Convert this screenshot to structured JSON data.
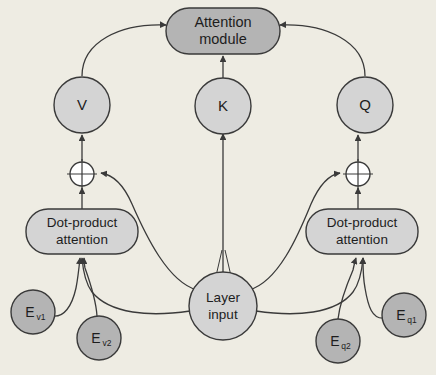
{
  "diagram": {
    "background_color": "#eeece3",
    "palette": {
      "dark_gray_fill": "#b4b4b4",
      "light_gray_fill": "#d4d4d4",
      "white_fill": "#ffffff",
      "stroke": "#3a3a3a",
      "text": "#1d1d1d"
    },
    "nodes": {
      "attention_module": {
        "label_line1": "Attention",
        "label_line2": "module",
        "shape": "rounded-rect",
        "fill": "#b4b4b4"
      },
      "v": {
        "label": "V",
        "shape": "circle",
        "fill": "#d4d4d4"
      },
      "k": {
        "label": "K",
        "shape": "circle",
        "fill": "#d4d4d4"
      },
      "q": {
        "label": "Q",
        "shape": "circle",
        "fill": "#d4d4d4"
      },
      "sum_left": {
        "label": "+",
        "shape": "circle-plus",
        "fill": "#ffffff"
      },
      "sum_right": {
        "label": "+",
        "shape": "circle-plus",
        "fill": "#ffffff"
      },
      "dot_product_left": {
        "label_line1": "Dot-product",
        "label_line2": "attention",
        "shape": "rounded-rect",
        "fill": "#d4d4d4"
      },
      "dot_product_right": {
        "label_line1": "Dot-product",
        "label_line2": "attention",
        "shape": "rounded-rect",
        "fill": "#d4d4d4"
      },
      "layer_input": {
        "label_line1": "Layer",
        "label_line2": "input",
        "shape": "circle",
        "fill": "#d4d4d4"
      },
      "e_v1": {
        "label_base": "E",
        "label_sub": "v1",
        "shape": "circle",
        "fill": "#b4b4b4"
      },
      "e_v2": {
        "label_base": "E",
        "label_sub": "v2",
        "shape": "circle",
        "fill": "#b4b4b4"
      },
      "e_q1": {
        "label_base": "E",
        "label_sub": "q1",
        "shape": "circle",
        "fill": "#b4b4b4"
      },
      "e_q2": {
        "label_base": "E",
        "label_sub": "q2",
        "shape": "circle",
        "fill": "#b4b4b4"
      }
    },
    "edges": [
      {
        "from": "v",
        "to": "attention_module",
        "style": "curved-arrow"
      },
      {
        "from": "k",
        "to": "attention_module",
        "style": "straight-arrow"
      },
      {
        "from": "q",
        "to": "attention_module",
        "style": "curved-arrow"
      },
      {
        "from": "sum_left",
        "to": "v",
        "style": "straight-arrow"
      },
      {
        "from": "sum_right",
        "to": "q",
        "style": "straight-arrow"
      },
      {
        "from": "dot_product_left",
        "to": "sum_left",
        "style": "straight-arrow"
      },
      {
        "from": "dot_product_right",
        "to": "sum_right",
        "style": "straight-arrow"
      },
      {
        "from": "layer_input",
        "to": "sum_left",
        "style": "curved-arrow"
      },
      {
        "from": "layer_input",
        "to": "sum_right",
        "style": "curved-arrow"
      },
      {
        "from": "layer_input",
        "to": "k",
        "style": "straight-arrow"
      },
      {
        "from": "layer_input",
        "to": "dot_product_left",
        "style": "curved-arrow"
      },
      {
        "from": "layer_input",
        "to": "dot_product_right",
        "style": "curved-arrow"
      },
      {
        "from": "e_v1",
        "to": "dot_product_left",
        "style": "curved-arrow"
      },
      {
        "from": "e_v2",
        "to": "dot_product_left",
        "style": "curved-arrow"
      },
      {
        "from": "e_q1",
        "to": "dot_product_right",
        "style": "curved-arrow"
      },
      {
        "from": "e_q2",
        "to": "dot_product_right",
        "style": "curved-arrow"
      }
    ]
  }
}
